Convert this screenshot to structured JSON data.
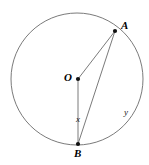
{
  "figure": {
    "type": "circle-geometry-diagram",
    "background_color": "#ffffff",
    "stroke_color": "#555555",
    "label_color": "#000000",
    "circle": {
      "center_label": "O",
      "center_x": 77,
      "center_y": 79,
      "radius_x": 66,
      "radius_y": 66
    },
    "points": [
      {
        "id": "A",
        "label": "A",
        "x": 115,
        "y": 31,
        "on_circle": true
      },
      {
        "id": "O",
        "label": "O",
        "x": 78,
        "y": 79,
        "on_circle": false
      },
      {
        "id": "B",
        "label": "B",
        "x": 78,
        "y": 144,
        "on_circle": true
      }
    ],
    "segments": [
      {
        "id": "OA",
        "from": "O",
        "to": "A",
        "name": "radius-oa"
      },
      {
        "id": "OB",
        "from": "O",
        "to": "B",
        "name": "radius-ob"
      },
      {
        "id": "AB",
        "from": "A",
        "to": "B",
        "name": "chord-ab"
      }
    ],
    "annotations": [
      {
        "id": "x",
        "label": "x",
        "x": 80,
        "y": 120,
        "meaning": "angle-at-b"
      },
      {
        "id": "y",
        "label": "y",
        "x": 128,
        "y": 113,
        "meaning": "arc-ab"
      }
    ]
  }
}
